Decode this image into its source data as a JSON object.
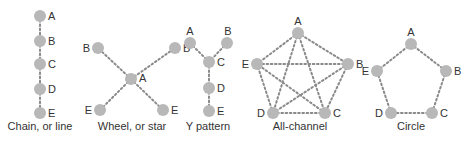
{
  "colors": {
    "node": "#b8b8b8",
    "edge": "#8a8a8a",
    "text": "#333333"
  },
  "networks": [
    {
      "id": "chain",
      "caption": "Chain, or line",
      "caption_pos": [
        40,
        130
      ],
      "nodes": [
        {
          "label": "A",
          "x": 40,
          "y": 16,
          "lx": 48,
          "ly": 20,
          "anchor": "start"
        },
        {
          "label": "B",
          "x": 40,
          "y": 41,
          "lx": 48,
          "ly": 45,
          "anchor": "start"
        },
        {
          "label": "C",
          "x": 40,
          "y": 64,
          "lx": 48,
          "ly": 68,
          "anchor": "start"
        },
        {
          "label": "D",
          "x": 40,
          "y": 89,
          "lx": 48,
          "ly": 93,
          "anchor": "start"
        },
        {
          "label": "E",
          "x": 40,
          "y": 113,
          "lx": 48,
          "ly": 117,
          "anchor": "start"
        }
      ],
      "edges": [
        [
          0,
          1
        ],
        [
          1,
          2
        ],
        [
          2,
          3
        ],
        [
          3,
          4
        ]
      ]
    },
    {
      "id": "wheel",
      "caption": "Wheel, or star",
      "caption_pos": [
        132,
        130
      ],
      "nodes": [
        {
          "label": "A",
          "x": 131,
          "y": 79,
          "lx": 139,
          "ly": 82,
          "anchor": "start"
        },
        {
          "label": "B",
          "x": 98,
          "y": 48,
          "lx": 90,
          "ly": 52,
          "anchor": "end"
        },
        {
          "label": "B",
          "x": 175,
          "y": 48,
          "lx": 183,
          "ly": 52,
          "anchor": "start"
        },
        {
          "label": "E",
          "x": 100,
          "y": 110,
          "lx": 92,
          "ly": 114,
          "anchor": "end"
        },
        {
          "label": "E",
          "x": 163,
          "y": 110,
          "lx": 171,
          "ly": 114,
          "anchor": "start"
        }
      ],
      "edges": [
        [
          0,
          1
        ],
        [
          0,
          2
        ],
        [
          0,
          3
        ],
        [
          0,
          4
        ]
      ]
    },
    {
      "id": "y-pattern",
      "caption": "Y pattern",
      "caption_pos": [
        208,
        130
      ],
      "nodes": [
        {
          "label": "A",
          "x": 190,
          "y": 43,
          "lx": 190,
          "ly": 35,
          "anchor": "middle"
        },
        {
          "label": "B",
          "x": 227,
          "y": 43,
          "lx": 228,
          "ly": 35,
          "anchor": "middle"
        },
        {
          "label": "C",
          "x": 209,
          "y": 62,
          "lx": 217,
          "ly": 66,
          "anchor": "start"
        },
        {
          "label": "D",
          "x": 209,
          "y": 88,
          "lx": 217,
          "ly": 92,
          "anchor": "start"
        },
        {
          "label": "E",
          "x": 209,
          "y": 111,
          "lx": 217,
          "ly": 115,
          "anchor": "start"
        }
      ],
      "edges": [
        [
          0,
          2
        ],
        [
          1,
          2
        ],
        [
          2,
          3
        ],
        [
          3,
          4
        ]
      ]
    },
    {
      "id": "all-channel",
      "caption": "All-channel",
      "caption_pos": [
        300,
        130
      ],
      "nodes": [
        {
          "label": "A",
          "x": 298,
          "y": 33,
          "lx": 298,
          "ly": 25,
          "anchor": "middle"
        },
        {
          "label": "B",
          "x": 348,
          "y": 64,
          "lx": 356,
          "ly": 68,
          "anchor": "start"
        },
        {
          "label": "C",
          "x": 325,
          "y": 113,
          "lx": 333,
          "ly": 117,
          "anchor": "start"
        },
        {
          "label": "D",
          "x": 273,
          "y": 113,
          "lx": 265,
          "ly": 117,
          "anchor": "end"
        },
        {
          "label": "E",
          "x": 257,
          "y": 64,
          "lx": 249,
          "ly": 68,
          "anchor": "end"
        }
      ],
      "edges": [
        [
          0,
          1
        ],
        [
          0,
          2
        ],
        [
          0,
          3
        ],
        [
          0,
          4
        ],
        [
          1,
          2
        ],
        [
          1,
          3
        ],
        [
          1,
          4
        ],
        [
          2,
          3
        ],
        [
          2,
          4
        ],
        [
          3,
          4
        ]
      ]
    },
    {
      "id": "circle",
      "caption": "Circle",
      "caption_pos": [
        411,
        130
      ],
      "nodes": [
        {
          "label": "A",
          "x": 411,
          "y": 44,
          "lx": 411,
          "ly": 36,
          "anchor": "middle"
        },
        {
          "label": "B",
          "x": 446,
          "y": 71,
          "lx": 454,
          "ly": 75,
          "anchor": "start"
        },
        {
          "label": "C",
          "x": 432,
          "y": 113,
          "lx": 440,
          "ly": 117,
          "anchor": "start"
        },
        {
          "label": "D",
          "x": 391,
          "y": 113,
          "lx": 383,
          "ly": 117,
          "anchor": "end"
        },
        {
          "label": "E",
          "x": 377,
          "y": 71,
          "lx": 369,
          "ly": 75,
          "anchor": "end"
        }
      ],
      "edges": [
        [
          0,
          1
        ],
        [
          1,
          2
        ],
        [
          2,
          3
        ],
        [
          3,
          4
        ],
        [
          4,
          0
        ]
      ]
    }
  ]
}
